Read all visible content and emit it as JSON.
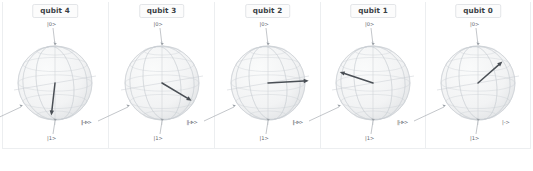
{
  "figure": {
    "background_color": "#ffffff",
    "frame_color": "#eceef0",
    "sphere_wire_color": "#c9cdd2",
    "sphere_fill_color": "#f2f3f4",
    "vector_color": "#4a4f55",
    "label_color": "#5d636a",
    "title_color": "#3a3f45"
  },
  "panels": [
    {
      "title": "qubit 4",
      "labels": {
        "top": "|0>",
        "bottom": "|1>",
        "left": "|+>",
        "right": "|->"
      },
      "vector": {
        "dx": -0.1,
        "dy": 0.88,
        "visible": true,
        "note": "points down, slightly left"
      }
    },
    {
      "title": "qubit 3",
      "labels": {
        "top": "|0>",
        "bottom": "|1>",
        "left": "|+>",
        "right": "|->"
      },
      "vector": {
        "dx": 0.8,
        "dy": 0.48,
        "visible": true,
        "note": "points down-right"
      }
    },
    {
      "title": "qubit 2",
      "labels": {
        "top": "|0>",
        "bottom": "|1>",
        "left": "|+>",
        "right": "|->"
      },
      "vector": {
        "dx": 1.1,
        "dy": -0.06,
        "visible": true,
        "note": "points right, near horizontal, past sphere edge"
      }
    },
    {
      "title": "qubit 1",
      "labels": {
        "top": "|0>",
        "bottom": "|1>",
        "left": "|+>",
        "right": "|->"
      },
      "vector": {
        "dx": -0.9,
        "dy": -0.3,
        "visible": true,
        "note": "points up-left"
      }
    },
    {
      "title": "qubit 0",
      "labels": {
        "top": "|0>",
        "bottom": "|1>",
        "left": "|+>",
        "right": "|->"
      },
      "vector": {
        "dx": 0.66,
        "dy": -0.58,
        "visible": true,
        "note": "points up-right"
      }
    }
  ],
  "chart_data": {
    "type": "scatter",
    "title": "",
    "xlabel": "",
    "ylabel": "",
    "subplot_count": 5,
    "subplot_titles": [
      "qubit 4",
      "qubit 3",
      "qubit 2",
      "qubit 1",
      "qubit 0"
    ],
    "axis_labels": [
      "|0>",
      "|1>",
      "|+>",
      "|->"
    ],
    "grid": true,
    "legend_position": "none",
    "series": [
      {
        "name": "qubit 4 bloch vector",
        "values": [
          -0.1,
          0.88
        ]
      },
      {
        "name": "qubit 3 bloch vector",
        "values": [
          0.8,
          0.48
        ]
      },
      {
        "name": "qubit 2 bloch vector",
        "values": [
          1.1,
          -0.06
        ]
      },
      {
        "name": "qubit 1 bloch vector",
        "values": [
          -0.9,
          -0.3
        ]
      },
      {
        "name": "qubit 0 bloch vector",
        "values": [
          0.66,
          -0.58
        ]
      }
    ]
  }
}
